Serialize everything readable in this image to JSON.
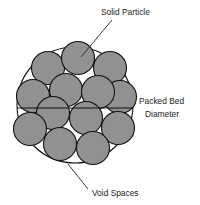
{
  "figure": {
    "background_color": "#ffffff"
  },
  "labels": {
    "solid_particle": "Solid Particle",
    "packed_bed_line1": "Packed Bed",
    "packed_bed_line2": "Diameter",
    "void_spaces": "Void Spaces"
  },
  "colors": {
    "particle_fill": "#919191",
    "particle_stroke": "#111111",
    "bed_stroke": "#111111",
    "leader_stroke": "#222222",
    "text": "#1a1a1a"
  },
  "geometry": {
    "bed": {
      "cx": 75,
      "cy": 105,
      "r": 58,
      "stroke_width": 1.1
    },
    "diameter_line": {
      "x1": 17,
      "y1": 108,
      "x2": 133,
      "y2": 108,
      "stroke_width": 1.1
    },
    "particle_radius": 16.5,
    "particle_stroke_width": 1.1,
    "particles": [
      {
        "cx": 48,
        "cy": 68
      },
      {
        "cx": 78,
        "cy": 58
      },
      {
        "cx": 110,
        "cy": 68
      },
      {
        "cx": 66,
        "cy": 90
      },
      {
        "cx": 33,
        "cy": 96
      },
      {
        "cx": 120,
        "cy": 97
      },
      {
        "cx": 98,
        "cy": 92
      },
      {
        "cx": 53,
        "cy": 113
      },
      {
        "cx": 30,
        "cy": 129
      },
      {
        "cx": 86,
        "cy": 118
      },
      {
        "cx": 118,
        "cy": 128
      },
      {
        "cx": 60,
        "cy": 144
      },
      {
        "cx": 93,
        "cy": 148
      }
    ],
    "leaders": {
      "solid_particle": {
        "x1": 81,
        "y1": 57,
        "x2": 112,
        "y2": 20
      },
      "packed_bed": {
        "x1": 133,
        "y1": 108,
        "x2": 133,
        "y2": 108
      },
      "void_spaces": {
        "x1": 68,
        "y1": 164,
        "x2": 88,
        "y2": 189
      }
    },
    "label_positions": {
      "solid_particle": {
        "x": 101,
        "y": 15
      },
      "packed_bed_line1": {
        "x": 139,
        "y": 104
      },
      "packed_bed_line2": {
        "x": 145,
        "y": 117
      },
      "void_spaces": {
        "x": 92,
        "y": 196
      }
    }
  },
  "chart_data": {
    "type": "diagram",
    "annotations": [
      {
        "label": "Solid Particle",
        "target": "shaded circle (particle)",
        "position": "top-right"
      },
      {
        "label": "Packed Bed Diameter",
        "target": "horizontal diameter line",
        "position": "right"
      },
      {
        "label": "Void Spaces",
        "target": "white gaps between particles",
        "position": "bottom"
      }
    ],
    "particle_count": 13,
    "bed_diameter_px": 116,
    "particle_diameter_px": 33
  }
}
